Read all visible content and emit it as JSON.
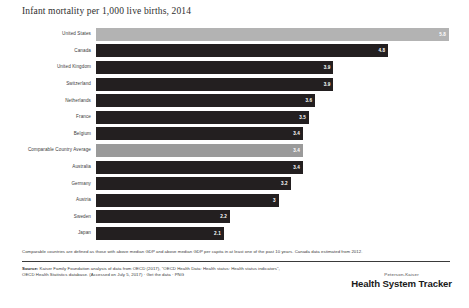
{
  "chart_data": {
    "type": "bar",
    "orientation": "horizontal",
    "title": "Infant mortality per 1,000 live births, 2014",
    "xlabel": "",
    "ylabel": "",
    "xlim": [
      0,
      5.8
    ],
    "grid": false,
    "legend": "none",
    "categories": [
      "United States",
      "Canada",
      "United Kingdom",
      "Switzerland",
      "Netherlands",
      "France",
      "Belgium",
      "Comparable Country Average",
      "Australia",
      "Germany",
      "Austria",
      "Sweden",
      "Japan"
    ],
    "values": [
      5.8,
      4.8,
      3.9,
      3.9,
      3.6,
      3.5,
      3.4,
      3.4,
      3.4,
      3.2,
      3,
      2.2,
      2.1
    ],
    "value_labels": [
      "5.8",
      "4.8",
      "3.9",
      "3.9",
      "3.6",
      "3.5",
      "3.4",
      "3.4",
      "3.4",
      "3.2",
      "3",
      "2.2",
      "2.1"
    ],
    "highlighted": [
      "United States",
      "Comparable Country Average"
    ],
    "colors": {
      "bar": "#231f20",
      "bar_highlight": "#9a9a9a",
      "bar_us": "#b3b3b3",
      "value_text": "#ffffff",
      "background": "#ffffff",
      "text": "#3a3a3a"
    }
  },
  "footnote": "Comparable countries are defined as those with above median GDP and above median GDP per capita in at least one of the past 10 years. Canada data estimated from 2012.",
  "source": {
    "label": "Source:",
    "line1": " Kaiser Family Foundation analysis of data from OECD (2017), \"OECD Health Data: Health status: Health status indicators\",",
    "line2": "OECD Health Statistics database. (Accessed on July 5, 2017) · Get the data · PNG"
  },
  "logo": {
    "top": "Peterson-Kaiser",
    "main": "Health System Tracker"
  }
}
